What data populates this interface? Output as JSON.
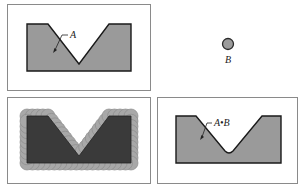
{
  "figure": {
    "panels": [
      {
        "id": "set-a",
        "label": "A"
      },
      {
        "id": "structuring-element-b",
        "label": "B"
      },
      {
        "id": "dilation-process",
        "label": ""
      },
      {
        "id": "dilation-result",
        "label": "A•B"
      }
    ]
  },
  "labels": {
    "a": "A",
    "b": "B",
    "result": "A•B"
  },
  "colors": {
    "panel_border": "#8a8a8a",
    "shape_fill": "#9a9a9a",
    "shape_outline": "#1a1a1a",
    "dark_fill": "#3a3a3a",
    "disk_fill": "#a8a8a8"
  }
}
